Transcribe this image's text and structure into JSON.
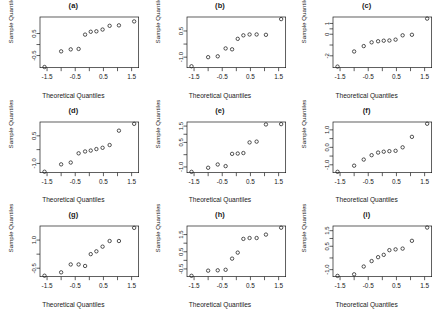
{
  "figure": {
    "type": "multi-panel-qq-grid",
    "rows": 3,
    "cols": 3,
    "background": "#ffffff",
    "foreground": "#1a1a1a",
    "point_style": "open-circle",
    "shared_xlabel": "Theoretical Quantiles",
    "shared_ylabel": "Sample Quantiles",
    "shared_xticks": [
      "-1.5",
      "-0.5",
      "0.5",
      "1.5"
    ],
    "shared_xlim": [
      -1.75,
      1.75
    ]
  },
  "chart_data": [
    {
      "type": "scatter",
      "title": "(a)",
      "xlabel": "Theoretical Quantiles",
      "ylabel": "Sample Quantiles",
      "xticks": [
        "-1.5",
        "-0.5",
        "0.5",
        "1.5"
      ],
      "xtickvals": [
        -1.5,
        -0.5,
        0.5,
        1.5
      ],
      "yticks": [
        "-0.5",
        "0.5"
      ],
      "ytickvals": [
        -0.5,
        0.5
      ],
      "xlim": [
        -1.75,
        1.75
      ],
      "ylim": [
        -1.05,
        1.25
      ],
      "grid": false,
      "legend": "none",
      "x": [
        -1.59,
        -1.0,
        -0.66,
        -0.38,
        -0.15,
        0.05,
        0.25,
        0.47,
        0.72,
        1.05,
        1.59
      ],
      "y": [
        -1.02,
        -0.31,
        -0.22,
        -0.2,
        0.45,
        0.58,
        0.6,
        0.68,
        0.85,
        0.87,
        1.05
      ]
    },
    {
      "type": "scatter",
      "title": "(b)",
      "xlabel": "Theoretical Quantiles",
      "ylabel": "Sample Quantiles",
      "xticks": [
        "-1.5",
        "-0.5",
        "0.5",
        "1.5"
      ],
      "xtickvals": [
        -1.5,
        -0.5,
        0.5,
        1.5
      ],
      "yticks": [
        "-1.0",
        "0.5"
      ],
      "ytickvals": [
        -1.0,
        0.5
      ],
      "xlim": [
        -1.75,
        1.75
      ],
      "ylim": [
        -1.6,
        1.3
      ],
      "grid": false,
      "legend": "none",
      "x": [
        -1.59,
        -1.0,
        -0.66,
        -0.38,
        -0.15,
        0.05,
        0.25,
        0.47,
        0.72,
        1.05,
        1.59
      ],
      "y": [
        -1.52,
        -1.0,
        -0.95,
        -0.5,
        -0.55,
        0.05,
        0.25,
        0.3,
        0.3,
        0.28,
        1.18
      ]
    },
    {
      "type": "scatter",
      "title": "(c)",
      "xlabel": "Theoretical Quantiles",
      "ylabel": "Sample Quantiles",
      "xticks": [
        "-1.5",
        "-0.5",
        "0.5",
        "1.5"
      ],
      "xtickvals": [
        -1.5,
        -0.5,
        0.5,
        1.5
      ],
      "yticks": [
        "-2",
        "0",
        "1"
      ],
      "ytickvals": [
        -2,
        0,
        1
      ],
      "xlim": [
        -1.75,
        1.75
      ],
      "ylim": [
        -3.1,
        1.6
      ],
      "grid": false,
      "legend": "none",
      "x": [
        -1.59,
        -1.0,
        -0.66,
        -0.38,
        -0.15,
        0.05,
        0.25,
        0.47,
        0.72,
        1.05,
        1.59
      ],
      "y": [
        -3.0,
        -1.6,
        -1.1,
        -0.75,
        -0.65,
        -0.6,
        -0.58,
        -0.5,
        -0.1,
        -0.05,
        1.45
      ]
    },
    {
      "type": "scatter",
      "title": "(d)",
      "xlabel": "Theoretical Quantiles",
      "ylabel": "Sample Quantiles",
      "xticks": [
        "-1.5",
        "-0.5",
        "0.5",
        "1.5"
      ],
      "xtickvals": [
        -1.5,
        -0.5,
        0.5,
        1.5
      ],
      "yticks": [
        "-1.0",
        "0.5"
      ],
      "ytickvals": [
        -1.0,
        0.5
      ],
      "xlim": [
        -1.75,
        1.75
      ],
      "ylim": [
        -1.5,
        1.25
      ],
      "grid": false,
      "legend": "none",
      "x": [
        -1.59,
        -1.0,
        -0.66,
        -0.38,
        -0.15,
        0.05,
        0.25,
        0.47,
        0.72,
        1.05,
        1.59
      ],
      "y": [
        -1.45,
        -1.05,
        -0.95,
        -0.45,
        -0.35,
        -0.3,
        -0.22,
        -0.15,
        0.0,
        0.78,
        1.15
      ]
    },
    {
      "type": "scatter",
      "title": "(e)",
      "xlabel": "Theoretical Quantiles",
      "ylabel": "Sample Quantiles",
      "xticks": [
        "-1.5",
        "-0.5",
        "0.5",
        "1.5"
      ],
      "xtickvals": [
        -1.5,
        -0.5,
        0.5,
        1.5
      ],
      "yticks": [
        "-1.0",
        "0.5",
        "1.5"
      ],
      "ytickvals": [
        -1.0,
        0.5,
        1.5
      ],
      "xlim": [
        -1.75,
        1.75
      ],
      "ylim": [
        -1.35,
        1.75
      ],
      "grid": false,
      "legend": "none",
      "x": [
        -1.59,
        -1.0,
        -0.66,
        -0.38,
        -0.15,
        0.05,
        0.25,
        0.47,
        0.72,
        1.05,
        1.59
      ],
      "y": [
        -1.3,
        -1.05,
        -0.85,
        -0.95,
        -0.2,
        -0.18,
        -0.15,
        0.5,
        0.55,
        1.6,
        1.62
      ]
    },
    {
      "type": "scatter",
      "title": "(f)",
      "xlabel": "Theoretical Quantiles",
      "ylabel": "Sample Quantiles",
      "xticks": [
        "-1.5",
        "-0.5",
        "0.5",
        "1.5"
      ],
      "xtickvals": [
        -1.5,
        -0.5,
        0.5,
        1.5
      ],
      "yticks": [
        "-1.0",
        "0.0",
        "1.0"
      ],
      "ytickvals": [
        -1.0,
        0.0,
        1.0
      ],
      "xlim": [
        -1.75,
        1.75
      ],
      "ylim": [
        -1.45,
        1.45
      ],
      "grid": false,
      "legend": "none",
      "x": [
        -1.59,
        -1.0,
        -0.66,
        -0.38,
        -0.15,
        0.05,
        0.25,
        0.47,
        0.72,
        1.05,
        1.59
      ],
      "y": [
        -1.4,
        -1.05,
        -0.7,
        -0.45,
        -0.3,
        -0.25,
        -0.22,
        -0.2,
        0.0,
        0.6,
        1.35
      ]
    },
    {
      "type": "scatter",
      "title": "(g)",
      "xlabel": "Theoretical Quantiles",
      "ylabel": "Sample Quantiles",
      "xticks": [
        "-1.5",
        "-0.5",
        "0.5",
        "1.5"
      ],
      "xtickvals": [
        -1.5,
        -0.5,
        0.5,
        1.5
      ],
      "yticks": [
        "-0.5",
        "1.0"
      ],
      "ytickvals": [
        -0.5,
        1.0
      ],
      "xlim": [
        -1.75,
        1.75
      ],
      "ylim": [
        -0.95,
        1.75
      ],
      "grid": false,
      "legend": "none",
      "x": [
        -1.59,
        -1.0,
        -0.66,
        -0.38,
        -0.15,
        0.05,
        0.25,
        0.47,
        0.72,
        1.05,
        1.59
      ],
      "y": [
        -0.9,
        -0.72,
        -0.3,
        -0.3,
        -0.38,
        0.25,
        0.4,
        0.65,
        0.95,
        0.95,
        1.65
      ]
    },
    {
      "type": "scatter",
      "title": "(h)",
      "xlabel": "Theoretical Quantiles",
      "ylabel": "Sample Quantiles",
      "xticks": [
        "-1.5",
        "-0.5",
        "0.5",
        "1.5"
      ],
      "xtickvals": [
        -1.5,
        -0.5,
        0.5,
        1.5
      ],
      "yticks": [
        "-0.5",
        "0.5",
        "1.5"
      ],
      "ytickvals": [
        -0.5,
        0.5,
        1.5
      ],
      "xlim": [
        -1.75,
        1.75
      ],
      "ylim": [
        -0.95,
        2.0
      ],
      "grid": false,
      "legend": "none",
      "x": [
        -1.59,
        -1.0,
        -0.66,
        -0.38,
        -0.15,
        0.05,
        0.25,
        0.47,
        0.72,
        1.05,
        1.59
      ],
      "y": [
        -0.9,
        -0.6,
        -0.58,
        -0.55,
        0.1,
        0.45,
        1.25,
        1.3,
        1.3,
        1.5,
        1.9
      ]
    },
    {
      "type": "scatter",
      "title": "(i)",
      "xlabel": "Theoretical Quantiles",
      "ylabel": "Sample Quantiles",
      "xticks": [
        "-1.5",
        "-0.5",
        "0.5",
        "1.5"
      ],
      "xtickvals": [
        -1.5,
        -0.5,
        0.5,
        1.5
      ],
      "yticks": [
        "-1.0",
        "0.5",
        "1.5"
      ],
      "ytickvals": [
        -1.0,
        0.5,
        1.5
      ],
      "xlim": [
        -1.75,
        1.75
      ],
      "ylim": [
        -1.45,
        1.8
      ],
      "grid": false,
      "legend": "none",
      "x": [
        -1.59,
        -1.0,
        -0.66,
        -0.38,
        -0.15,
        0.05,
        0.25,
        0.47,
        0.72,
        1.05,
        1.59
      ],
      "y": [
        -1.4,
        -1.3,
        -0.8,
        -0.45,
        -0.2,
        -0.05,
        0.25,
        0.3,
        0.35,
        0.85,
        1.7
      ]
    }
  ]
}
